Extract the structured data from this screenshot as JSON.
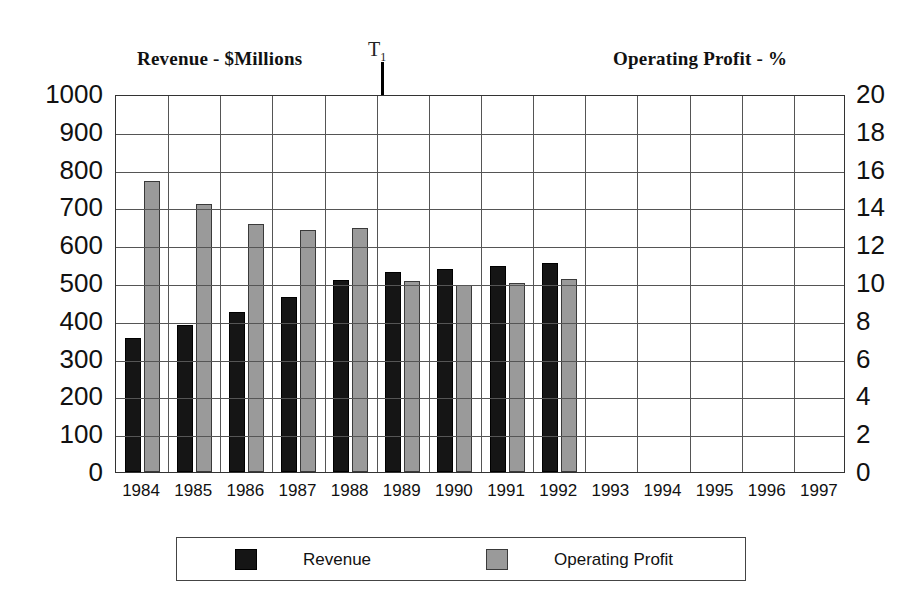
{
  "titles": {
    "left": "Revenue - $Millions",
    "right": "Operating Profit - %"
  },
  "annotation": {
    "t1_label": "T",
    "t1_subscript": "1"
  },
  "legend": {
    "revenue_label": "Revenue",
    "profit_label": "Operating Profit",
    "revenue_color": "#151515",
    "profit_color": "#9a9a9a"
  },
  "axes": {
    "left_ticks": [
      "1000",
      "900",
      "800",
      "700",
      "600",
      "500",
      "400",
      "300",
      "200",
      "100",
      "0"
    ],
    "right_ticks": [
      "20",
      "18",
      "16",
      "14",
      "12",
      "10",
      "8",
      "6",
      "4",
      "2",
      "0"
    ],
    "x_ticks": [
      "1984",
      "1985",
      "1986",
      "1987",
      "1988",
      "1989",
      "1990",
      "1991",
      "1992",
      "1993",
      "1994",
      "1995",
      "1996",
      "1997"
    ]
  },
  "chart_data": {
    "type": "bar",
    "xlabel": "",
    "ylabel": "Revenue - $Millions",
    "y2label": "Operating Profit - %",
    "ylim": [
      0,
      1000
    ],
    "y2lim": [
      0,
      20
    ],
    "grid": true,
    "legend_position": "bottom",
    "categories": [
      "1984",
      "1985",
      "1986",
      "1987",
      "1988",
      "1989",
      "1990",
      "1991",
      "1992",
      "1993",
      "1994",
      "1995",
      "1996",
      "1997"
    ],
    "annotations": [
      {
        "text": "T1",
        "type": "vertical-line",
        "at_category": "1988/1989 boundary"
      }
    ],
    "series": [
      {
        "name": "Revenue",
        "axis": "left",
        "units": "$Millions",
        "color": "#151515",
        "values": [
          355,
          388,
          422,
          463,
          507,
          530,
          537,
          545,
          552,
          null,
          null,
          null,
          null,
          null
        ]
      },
      {
        "name": "Operating Profit",
        "axis": "right",
        "units": "%",
        "color": "#9a9a9a",
        "values": [
          15.4,
          14.2,
          13.1,
          12.8,
          12.9,
          10.1,
          9.9,
          10.0,
          10.2,
          null,
          null,
          null,
          null,
          null
        ]
      }
    ],
    "operating_profit_left_axis_equivalent": [
      770,
      710,
      655,
      640,
      645,
      505,
      495,
      500,
      510,
      null,
      null,
      null,
      null,
      null
    ]
  }
}
